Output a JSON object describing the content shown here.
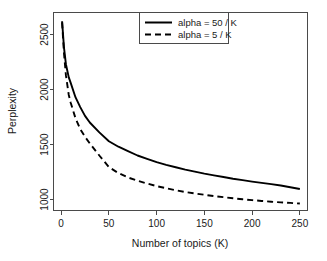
{
  "figure": {
    "background_color": "#ffffff",
    "axis_color": "#4a4a4a",
    "line_color": "#000000"
  },
  "chart_data": {
    "type": "line",
    "title": "",
    "xlabel": "Number of topics (K)",
    "ylabel": "Perplexity",
    "xlim": [
      -8,
      258
    ],
    "ylim": [
      900,
      2700
    ],
    "xticks": [
      0,
      50,
      100,
      150,
      200,
      250
    ],
    "xticklabels": [
      "0",
      "50",
      "100",
      "150",
      "200",
      "250"
    ],
    "yticks": [
      1000,
      1500,
      2000,
      2500
    ],
    "yticklabels": [
      "1000",
      "1500",
      "2000",
      "2500"
    ],
    "grid": false,
    "legend_position": "top-right",
    "series": [
      {
        "name": "alpha = 50 / K",
        "style": "solid",
        "color": "#000000",
        "x": [
          1,
          3,
          5,
          8,
          10,
          15,
          20,
          25,
          30,
          40,
          50,
          60,
          70,
          80,
          90,
          100,
          110,
          120,
          130,
          140,
          150,
          160,
          170,
          180,
          190,
          200,
          210,
          220,
          230,
          240,
          250
        ],
        "y": [
          2620,
          2380,
          2230,
          2110,
          2060,
          1930,
          1840,
          1760,
          1700,
          1610,
          1530,
          1480,
          1440,
          1400,
          1370,
          1340,
          1315,
          1293,
          1272,
          1253,
          1235,
          1219,
          1204,
          1189,
          1176,
          1163,
          1151,
          1140,
          1127,
          1111,
          1095
        ]
      },
      {
        "name": "alpha = 5 / K",
        "style": "dashed",
        "color": "#000000",
        "x": [
          1,
          3,
          5,
          8,
          10,
          15,
          20,
          25,
          30,
          40,
          50,
          60,
          70,
          80,
          90,
          100,
          110,
          120,
          130,
          140,
          150,
          160,
          170,
          180,
          190,
          200,
          210,
          220,
          230,
          240,
          250
        ],
        "y": [
          2610,
          2330,
          2130,
          1950,
          1880,
          1740,
          1640,
          1570,
          1510,
          1400,
          1295,
          1240,
          1200,
          1170,
          1145,
          1122,
          1102,
          1084,
          1068,
          1055,
          1043,
          1031,
          1021,
          1011,
          1002,
          994,
          987,
          980,
          974,
          969,
          963
        ]
      }
    ]
  },
  "legend": {
    "entries": [
      {
        "label": "alpha = 50 / K",
        "style": "solid"
      },
      {
        "label": "alpha = 5 / K",
        "style": "dashed"
      }
    ]
  }
}
